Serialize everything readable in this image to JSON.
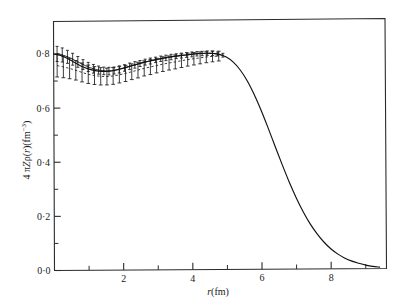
{
  "figure": {
    "name": "nuclear-charge-density-plot",
    "background_color": "#ffffff",
    "frame_color": "#2b2b2b",
    "curve_color": "#111111",
    "errorbar_color": "#1a1a1a"
  },
  "chart_data": {
    "type": "line",
    "title": "",
    "subtitle": "",
    "xlabel": "r(fm)",
    "ylabel": "4 πZρ(r)(fm⁻³)",
    "xlim": [
      0,
      9.6
    ],
    "ylim": [
      0.0,
      0.92
    ],
    "grid": false,
    "legend": null,
    "x_ticks_major": [
      2,
      4,
      6,
      8
    ],
    "x_tick_labels": [
      "2",
      "4",
      "6",
      "8"
    ],
    "x_ticks_minor": [
      1,
      3,
      5,
      7,
      9
    ],
    "y_ticks_major": [
      0.0,
      0.2,
      0.4,
      0.6,
      0.8
    ],
    "y_tick_labels": [
      "0·0",
      "0·2",
      "0·4",
      "0·6",
      "0·8"
    ],
    "y_ticks_minor": [
      0.1,
      0.3,
      0.5,
      0.7
    ],
    "series": [
      {
        "name": "charge-density-solid-curve",
        "style": "solid",
        "x": [
          0.0,
          0.2,
          0.4,
          0.6,
          0.8,
          1.0,
          1.2,
          1.4,
          1.6,
          1.8,
          2.0,
          2.2,
          2.4,
          2.6,
          2.8,
          3.0,
          3.2,
          3.4,
          3.6,
          3.8,
          4.0,
          4.2,
          4.4,
          4.6,
          4.8,
          5.0,
          5.2,
          5.4,
          5.6,
          5.8,
          6.0,
          6.2,
          6.4,
          6.6,
          6.8,
          7.0,
          7.2,
          7.4,
          7.6,
          7.8,
          8.0,
          8.2,
          8.4,
          8.6,
          8.8,
          9.0,
          9.2,
          9.4
        ],
        "y": [
          0.8,
          0.794,
          0.783,
          0.768,
          0.754,
          0.744,
          0.737,
          0.734,
          0.735,
          0.739,
          0.745,
          0.752,
          0.759,
          0.766,
          0.772,
          0.777,
          0.782,
          0.786,
          0.789,
          0.792,
          0.795,
          0.797,
          0.798,
          0.797,
          0.793,
          0.783,
          0.764,
          0.735,
          0.695,
          0.644,
          0.585,
          0.52,
          0.452,
          0.385,
          0.321,
          0.263,
          0.211,
          0.166,
          0.129,
          0.098,
          0.073,
          0.054,
          0.039,
          0.028,
          0.02,
          0.013,
          0.008,
          0.005
        ]
      },
      {
        "name": "upper-errorbar-data",
        "style": "dotted-with-errorbars",
        "x": [
          0.1,
          0.25,
          0.4,
          0.55,
          0.7,
          0.85,
          1.0,
          1.15,
          1.3,
          1.45,
          1.6,
          1.75,
          1.9,
          2.05,
          2.2,
          2.35,
          2.5,
          2.65,
          2.8,
          2.95,
          3.1,
          3.25,
          3.4,
          3.55,
          3.7,
          3.85,
          4.0,
          4.15,
          4.3,
          4.45,
          4.6,
          4.75,
          4.9
        ],
        "y": [
          0.8,
          0.796,
          0.789,
          0.78,
          0.77,
          0.76,
          0.751,
          0.744,
          0.739,
          0.736,
          0.735,
          0.737,
          0.741,
          0.746,
          0.752,
          0.757,
          0.762,
          0.767,
          0.771,
          0.775,
          0.779,
          0.782,
          0.785,
          0.788,
          0.79,
          0.792,
          0.794,
          0.796,
          0.797,
          0.798,
          0.797,
          0.795,
          0.79
        ],
        "yerr": [
          0.028,
          0.026,
          0.024,
          0.022,
          0.02,
          0.018,
          0.017,
          0.016,
          0.015,
          0.014,
          0.014,
          0.013,
          0.013,
          0.012,
          0.012,
          0.012,
          0.011,
          0.011,
          0.011,
          0.01,
          0.01,
          0.01,
          0.01,
          0.009,
          0.009,
          0.009,
          0.009,
          0.008,
          0.008,
          0.008,
          0.008,
          0.007,
          0.007
        ]
      },
      {
        "name": "lower-errorbar-data",
        "style": "dashed-with-errorbars",
        "x": [
          0.1,
          0.28,
          0.46,
          0.64,
          0.82,
          1.0,
          1.18,
          1.36,
          1.54,
          1.72,
          1.9,
          2.08,
          2.26,
          2.44,
          2.62,
          2.8,
          2.98,
          3.16,
          3.34,
          3.52,
          3.7,
          3.88,
          4.06,
          4.24,
          4.42,
          4.6,
          4.78
        ],
        "y": [
          0.757,
          0.752,
          0.746,
          0.739,
          0.731,
          0.724,
          0.719,
          0.716,
          0.715,
          0.717,
          0.721,
          0.726,
          0.732,
          0.738,
          0.744,
          0.749,
          0.754,
          0.759,
          0.763,
          0.767,
          0.771,
          0.775,
          0.778,
          0.781,
          0.784,
          0.786,
          0.787
        ],
        "yerr": [
          0.042,
          0.04,
          0.038,
          0.036,
          0.035,
          0.034,
          0.033,
          0.032,
          0.031,
          0.031,
          0.03,
          0.03,
          0.029,
          0.029,
          0.028,
          0.028,
          0.027,
          0.027,
          0.026,
          0.026,
          0.025,
          0.024,
          0.023,
          0.022,
          0.021,
          0.02,
          0.018
        ]
      }
    ]
  }
}
